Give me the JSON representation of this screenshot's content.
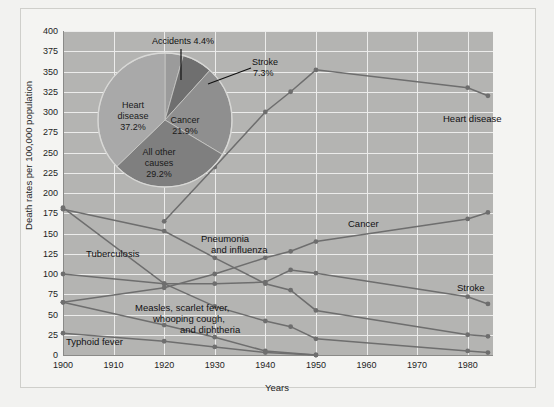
{
  "chart_data": {
    "type": "line",
    "title": "",
    "xlabel": "Years",
    "ylabel": "Death rates per 100,000 population",
    "xlim": [
      1900,
      1985
    ],
    "ylim": [
      0,
      400
    ],
    "yticks": [
      0,
      25,
      50,
      75,
      100,
      125,
      150,
      175,
      200,
      225,
      250,
      275,
      300,
      325,
      350,
      375,
      400
    ],
    "xticks": [
      1900,
      1910,
      1920,
      1930,
      1940,
      1950,
      1960,
      1970,
      1980
    ],
    "grid": true,
    "legend_position": "inline-annotations",
    "series": [
      {
        "name": "Heart disease",
        "color": "#6e6e6e",
        "x": [
          1920,
          1930,
          1940,
          1945,
          1950,
          1980,
          1984
        ],
        "values": [
          165,
          232,
          300,
          325,
          352,
          330,
          320
        ]
      },
      {
        "name": "Cancer",
        "color": "#6e6e6e",
        "x": [
          1900,
          1920,
          1930,
          1940,
          1945,
          1950,
          1980,
          1984
        ],
        "values": [
          65,
          83,
          100,
          120,
          128,
          140,
          168,
          176
        ]
      },
      {
        "name": "Stroke",
        "color": "#6e6e6e",
        "x": [
          1900,
          1920,
          1930,
          1940,
          1945,
          1950,
          1980,
          1984
        ],
        "values": [
          100,
          88,
          88,
          90,
          105,
          101,
          72,
          63
        ]
      },
      {
        "name": "Pneumonia and influenza",
        "color": "#6e6e6e",
        "x": [
          1900,
          1920,
          1930,
          1940,
          1945,
          1950,
          1980,
          1984
        ],
        "values": [
          180,
          153,
          120,
          88,
          80,
          55,
          25,
          23
        ]
      },
      {
        "name": "Tuberculosis",
        "color": "#6e6e6e",
        "x": [
          1900,
          1920,
          1930,
          1940,
          1945,
          1950,
          1980,
          1984
        ],
        "values": [
          182,
          88,
          60,
          42,
          35,
          20,
          5,
          3
        ]
      },
      {
        "name": "Measles, scarlet fever, whooping cough, and diphtheria",
        "color": "#6e6e6e",
        "x": [
          1900,
          1920,
          1930,
          1940,
          1950
        ],
        "values": [
          65,
          37,
          22,
          5,
          0
        ]
      },
      {
        "name": "Typhoid fever",
        "color": "#6e6e6e",
        "x": [
          1900,
          1920,
          1930,
          1940,
          1950
        ],
        "values": [
          27,
          17,
          10,
          3,
          0
        ]
      }
    ],
    "annotations": [
      {
        "text": "Heart disease",
        "x": 1968,
        "y": 320
      },
      {
        "text": "Cancer",
        "x": 1952,
        "y": 160
      },
      {
        "text": "Stroke",
        "x": 1966,
        "y": 90
      },
      {
        "text": "Pneumonia",
        "x": 1924,
        "y": 140
      },
      {
        "text": "and influenza",
        "x": 1926,
        "y": 130
      },
      {
        "text": "Tuberculosis",
        "x": 1903,
        "y": 128
      },
      {
        "text": "Measles, scarlet fever,",
        "x": 1912,
        "y": 52
      },
      {
        "text": "whooping cough,",
        "x": 1916,
        "y": 42
      },
      {
        "text": "and diphtheria",
        "x": 1922,
        "y": 32
      },
      {
        "text": "Typhoid fever",
        "x": 1900,
        "y": 12
      }
    ],
    "inset_pie": {
      "type": "pie",
      "title": "",
      "categories": [
        "Heart disease",
        "Cancer",
        "All other causes",
        "Stroke",
        "Accidents"
      ],
      "values": [
        37.2,
        21.9,
        29.2,
        7.3,
        4.4
      ],
      "labels": [
        "37.2%",
        "21.9%",
        "29.2%",
        "7.3%",
        "4.4%"
      ],
      "colors": [
        "#a9a9a9",
        "#8f8f8f",
        "#7f7f7f",
        "#6f6f6f",
        "#9b9b9b"
      ]
    }
  },
  "axes": {
    "ylabel": "Death rates per 100,000 population",
    "xlabel": "Years",
    "yticks": [
      "400",
      "375",
      "350",
      "325",
      "300",
      "275",
      "250",
      "225",
      "200",
      "175",
      "150",
      "125",
      "100",
      "75",
      "50",
      "25",
      "0"
    ],
    "xticks": [
      "1900",
      "1910",
      "1920",
      "1930",
      "1940",
      "1950",
      "1960",
      "1970",
      "1980"
    ]
  },
  "pie": {
    "heart_disease": "Heart\ndisease\n37.2%",
    "heart_disease_l1": "Heart",
    "heart_disease_l2": "disease",
    "heart_disease_l3": "37.2%",
    "cancer_l1": "Cancer",
    "cancer_l2": "21.9%",
    "other_l1": "All other",
    "other_l2": "causes",
    "other_l3": "29.2%",
    "accidents": "Accidents 4.4%",
    "stroke_l1": "Stroke",
    "stroke_l2": "7.3%"
  },
  "series_labels": {
    "heart_disease": "Heart disease",
    "cancer": "Cancer",
    "stroke": "Stroke",
    "pneumonia_l1": "Pneumonia",
    "pneumonia_l2": "and influenza",
    "tuberculosis": "Tuberculosis",
    "measles_l1": "Measles, scarlet fever,",
    "measles_l2": "whooping cough,",
    "measles_l3": "and diphtheria",
    "typhoid": "Typhoid fever"
  },
  "colors": {
    "plot_background": "#b4b4b2",
    "grid": "#ececeb",
    "line": "#6e6e6e",
    "page_background": "#f2f2f0"
  }
}
